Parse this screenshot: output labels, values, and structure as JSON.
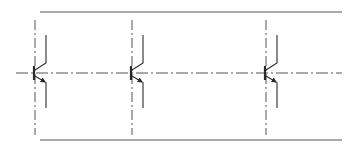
{
  "diagram": {
    "type": "circuit-schematic",
    "colors": {
      "background": "#ffffff",
      "stroke": "#2a2a2a",
      "rail": "#555555",
      "centerline": "#555555"
    },
    "rails": {
      "top": {
        "x1": 40,
        "x2": 342,
        "y": 12
      },
      "bottom": {
        "x1": 40,
        "x2": 342,
        "y": 140
      }
    },
    "centerline": {
      "x1": 16,
      "x2": 342,
      "y": 73
    },
    "transistors": [
      {
        "id": "Q1",
        "base_x": 34,
        "axis_top": 20,
        "axis_bottom": 135
      },
      {
        "id": "Q2",
        "base_x": 131,
        "axis_top": 20,
        "axis_bottom": 135
      },
      {
        "id": "Q3",
        "base_x": 265,
        "axis_top": 20,
        "axis_bottom": 135
      }
    ]
  }
}
